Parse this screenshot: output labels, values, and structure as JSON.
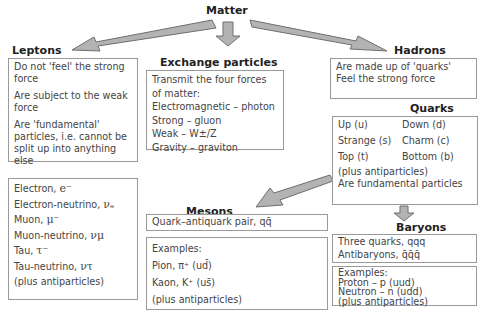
{
  "root": {
    "title": "Matter"
  },
  "leptons": {
    "title": "Leptons",
    "properties": [
      "Do not 'feel' the strong force",
      "Are subject to the weak force",
      "Are 'fundamental' particles, i.e. cannot be split up into anything else"
    ],
    "particles": [
      {
        "name": "Electron, ",
        "symbol": "e⁻"
      },
      {
        "name": "Electron-neutrino, ",
        "symbol": "νₑ"
      },
      {
        "name": "Muon, ",
        "symbol": "μ⁻"
      },
      {
        "name": "Muon-neutrino, ",
        "symbol": "νμ"
      },
      {
        "name": "Tau, ",
        "symbol": "τ⁻"
      },
      {
        "name": "Tau-neutrino, ",
        "symbol": "ντ"
      }
    ],
    "footer": "(plus antiparticles)"
  },
  "exchange": {
    "title": "Exchange particles",
    "intro": "Transmit the four forces of matter:",
    "forces": [
      "Electromagnetic – photon",
      "Strong – gluon",
      "Weak – W±/Z",
      "Gravity – graviton"
    ]
  },
  "hadrons": {
    "title": "Hadrons",
    "lines": [
      "Are made up of 'quarks'",
      "Feel the strong force"
    ]
  },
  "quarks": {
    "title": "Quarks",
    "grid": [
      "Up (u)",
      "Down (d)",
      "Strange (s)",
      "Charm (c)",
      "Top (t)",
      "Bottom (b)"
    ],
    "footer1": "(plus antiparticles)",
    "footer2": "Are fundamental particles"
  },
  "mesons": {
    "title": "Mesons",
    "definition": "Quark–antiquark pair, qq̄",
    "examples_label": "Examples:",
    "examples": [
      "Pion, π⁺ (ud̄)",
      "Kaon, K⁺ (us̄)"
    ],
    "footer": "(plus antiparticles)"
  },
  "baryons": {
    "title": "Baryons",
    "lines": [
      "Three quarks, qqq",
      "Antibaryons, q̄q̄q̄"
    ],
    "examples_label": "Examples:",
    "examples": [
      "Proton – p (uud)",
      "Neutron – n (udd)"
    ],
    "footer": "(plus antiparticles)"
  },
  "colors": {
    "arrow_fill": "#b3b3b3",
    "arrow_stroke": "#6e6e6e",
    "border": "#9a9a9a"
  }
}
